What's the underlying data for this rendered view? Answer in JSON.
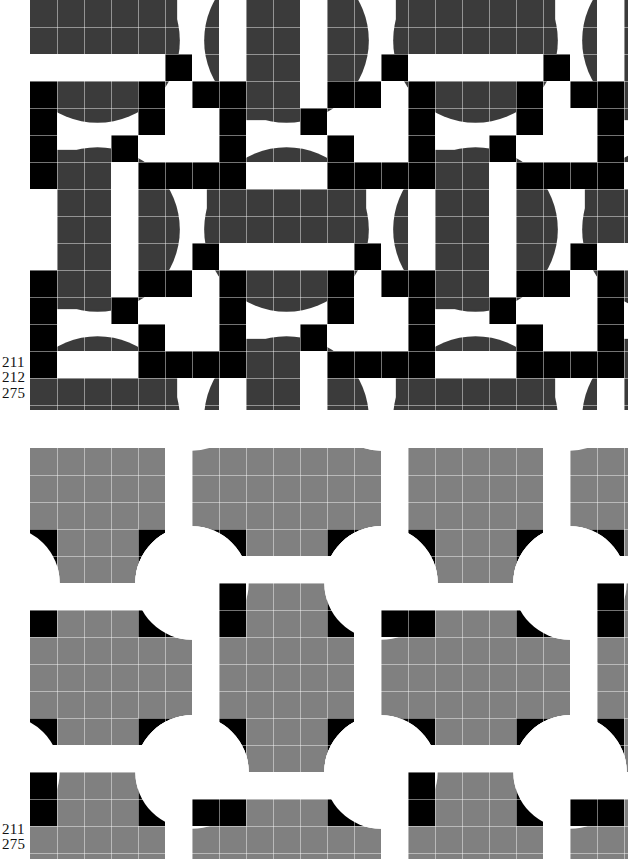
{
  "page": {
    "width": 633,
    "height": 859,
    "background": "#ffffff"
  },
  "colors": {
    "white": "#ffffff",
    "black": "#000000",
    "dark_gray": "#3b3b3b",
    "mid_gray": "#808080",
    "seam": "#e8e8e8",
    "text": "#111111"
  },
  "panels": [
    {
      "id": "panel-top",
      "name": "top-pattern-panel",
      "x": 30,
      "y": 0,
      "width": 598,
      "height": 410,
      "cell": 27,
      "cols": 22,
      "rows": 15,
      "fill": "#3b3b3b",
      "tile_variants": [
        "horizontal-bars-on-disc",
        "vertical-bars-on-disc"
      ],
      "labels": [
        "211",
        "212",
        "275"
      ]
    },
    {
      "id": "panel-bottom",
      "name": "bottom-pattern-panel",
      "x": 30,
      "y": 448,
      "width": 598,
      "height": 411,
      "cell": 27,
      "cols": 22,
      "rows": 15,
      "fill": "#808080",
      "tile_variants": [
        "concave-cross",
        "inverted-disc-cluster"
      ],
      "labels": [
        "211",
        "275"
      ]
    }
  ],
  "labels": {
    "top": [
      "211",
      "212",
      "275"
    ],
    "bottom": [
      "211",
      "275"
    ]
  },
  "label_values": {
    "l211": "211",
    "l212": "212",
    "l275": "275",
    "b211": "211",
    "b275": "275"
  }
}
